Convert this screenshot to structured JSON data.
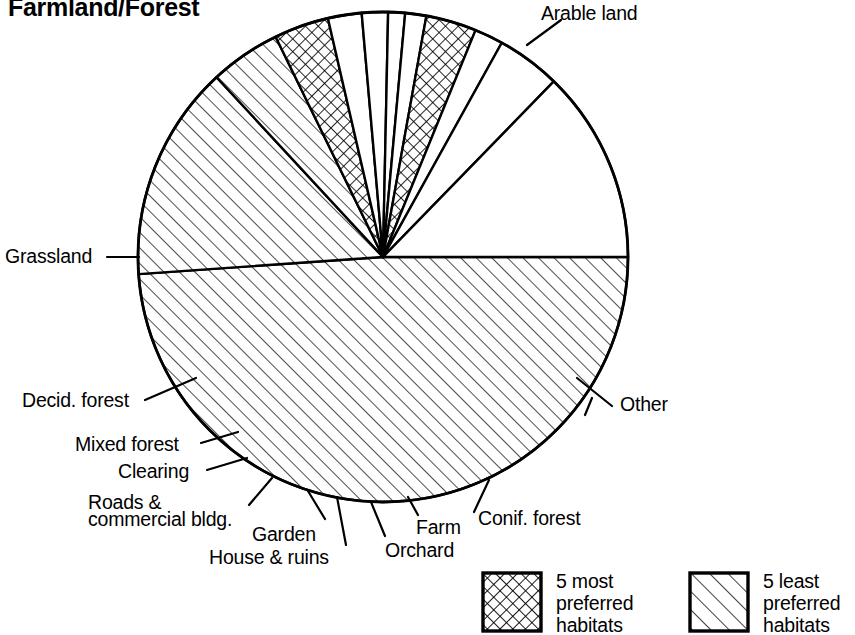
{
  "chart": {
    "title": "Farmland/Forest",
    "type": "pie"
  },
  "chart_data": {
    "type": "pie",
    "title": "Farmland/Forest",
    "xlabel": "",
    "ylabel": "",
    "grid": false,
    "legend_position": "bottom",
    "units": "percent of area",
    "note": "Slice sizes estimated from sweep angles; total 360 degrees.",
    "categories": [
      "Arable land",
      "Other",
      "Conif. forest",
      "Farm",
      "Orchard",
      "House & ruins",
      "Garden",
      "Roads & commercial bldg.",
      "Clearing",
      "Mixed forest",
      "Decid. forest",
      "Grassland"
    ],
    "values": [
      48.9,
      12.8,
      4.2,
      1.9,
      3.3,
      1.4,
      1.1,
      1.7,
      2.2,
      3.6,
      4.7,
      14.2
    ],
    "slices": [
      {
        "label": "Arable land",
        "value": 48.9,
        "start_angle": 0,
        "end_angle": 176.0,
        "pattern": "diagonal-hatch"
      },
      {
        "label": "Grassland",
        "value": 14.2,
        "start_angle": 176.0,
        "end_angle": 227.2,
        "pattern": "diagonal-hatch"
      },
      {
        "label": "Decid. forest",
        "value": 4.7,
        "start_angle": 227.2,
        "end_angle": 244.0,
        "pattern": "diagonal-hatch"
      },
      {
        "label": "Mixed forest",
        "value": 3.6,
        "start_angle": 244.0,
        "end_angle": 257.0,
        "pattern": "cross-hatch"
      },
      {
        "label": "Clearing",
        "value": 2.2,
        "start_angle": 257.0,
        "end_angle": 265.0,
        "pattern": "blank"
      },
      {
        "label": "Roads & commercial bldg.",
        "value": 1.7,
        "start_angle": 265.0,
        "end_angle": 271.2,
        "pattern": "blank"
      },
      {
        "label": "Garden",
        "value": 1.1,
        "start_angle": 271.2,
        "end_angle": 275.2,
        "pattern": "blank"
      },
      {
        "label": "House & ruins",
        "value": 1.4,
        "start_angle": 275.2,
        "end_angle": 280.2,
        "pattern": "blank"
      },
      {
        "label": "Orchard",
        "value": 3.3,
        "start_angle": 280.2,
        "end_angle": 292.2,
        "pattern": "cross-hatch"
      },
      {
        "label": "Farm",
        "value": 1.9,
        "start_angle": 292.2,
        "end_angle": 299.0,
        "pattern": "blank"
      },
      {
        "label": "Conif. forest",
        "value": 4.2,
        "start_angle": 299.0,
        "end_angle": 314.2,
        "pattern": "blank"
      },
      {
        "label": "Other",
        "value": 12.8,
        "start_angle": 314.2,
        "end_angle": 360.0,
        "pattern": "blank"
      }
    ],
    "legend": [
      {
        "label": "5 most\npreferred\nhabitats",
        "pattern": "cross-hatch"
      },
      {
        "label": "5 least\npreferred\nhabitats",
        "pattern": "diagonal-hatch"
      }
    ]
  },
  "labels": {
    "arable_land": "Arable land",
    "grassland": "Grassland",
    "decid_forest": "Decid. forest",
    "mixed_forest": "Mixed forest",
    "clearing": "Clearing",
    "roads_line1": "Roads &",
    "roads_line2": "commercial bldg.",
    "garden": "Garden",
    "house_ruins": "House & ruins",
    "orchard": "Orchard",
    "farm": "Farm",
    "conif_forest": "Conif. forest",
    "other": "Other"
  },
  "legend": {
    "most": "5 most\npreferred\nhabitats",
    "least": "5 least\npreferred\nhabitats"
  },
  "colors": {
    "stroke": "#000000",
    "background": "#ffffff"
  }
}
